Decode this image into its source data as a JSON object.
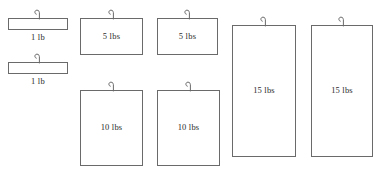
{
  "diagram": {
    "background_color": "#ffffff",
    "stroke_color": "#6a6a6a",
    "text_color": "#2b2b2b",
    "hook_icon": "hook-icon",
    "weights": [
      {
        "id": "weight-1lb-a",
        "label": "1 lb",
        "value": 1,
        "unit": "lb",
        "shape": "bar",
        "label_position": "below",
        "x": 8,
        "y": 18,
        "width": 60,
        "height": 12
      },
      {
        "id": "weight-1lb-b",
        "label": "1 lb",
        "value": 1,
        "unit": "lb",
        "shape": "bar",
        "label_position": "below",
        "x": 8,
        "y": 62,
        "width": 60,
        "height": 12
      },
      {
        "id": "weight-5lbs-a",
        "label": "5 lbs",
        "value": 5,
        "unit": "lbs",
        "shape": "plate",
        "label_position": "inside",
        "x": 80,
        "y": 18,
        "width": 63,
        "height": 37
      },
      {
        "id": "weight-5lbs-b",
        "label": "5 lbs",
        "value": 5,
        "unit": "lbs",
        "shape": "plate",
        "label_position": "inside",
        "x": 157,
        "y": 18,
        "width": 61,
        "height": 37
      },
      {
        "id": "weight-10lbs-a",
        "label": "10 lbs",
        "value": 10,
        "unit": "lbs",
        "shape": "plate",
        "label_position": "inside",
        "x": 80,
        "y": 90,
        "width": 63,
        "height": 76
      },
      {
        "id": "weight-10lbs-b",
        "label": "10 lbs",
        "value": 10,
        "unit": "lbs",
        "shape": "plate",
        "label_position": "inside",
        "x": 157,
        "y": 90,
        "width": 63,
        "height": 76
      },
      {
        "id": "weight-15lbs-a",
        "label": "15 lbs",
        "value": 15,
        "unit": "lbs",
        "shape": "plate",
        "label_position": "inside",
        "x": 232,
        "y": 25,
        "width": 64,
        "height": 132
      },
      {
        "id": "weight-15lbs-b",
        "label": "15 lbs",
        "value": 15,
        "unit": "lbs",
        "shape": "plate",
        "label_position": "inside",
        "x": 311,
        "y": 25,
        "width": 62,
        "height": 132
      }
    ]
  }
}
